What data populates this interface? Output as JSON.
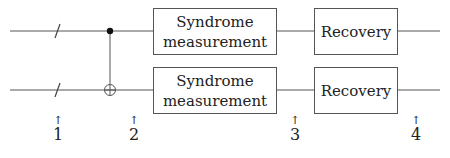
{
  "diagram": {
    "type": "quantum-circuit",
    "wires": [
      {
        "id": "top",
        "y": 31
      },
      {
        "id": "bottom",
        "y": 90
      }
    ],
    "gates": [
      {
        "type": "register-slash",
        "wire": "top"
      },
      {
        "type": "register-slash",
        "wire": "bottom"
      },
      {
        "type": "cnot",
        "control": "top",
        "target": "bottom"
      }
    ],
    "boxes": [
      {
        "id": "syndrome-top",
        "label_line1": "Syndrome",
        "label_line2": "measurement"
      },
      {
        "id": "syndrome-bottom",
        "label_line1": "Syndrome",
        "label_line2": "measurement"
      },
      {
        "id": "recovery-top",
        "label": "Recovery"
      },
      {
        "id": "recovery-bottom",
        "label": "Recovery"
      }
    ],
    "markers": [
      {
        "arrow": "↑",
        "label": "1"
      },
      {
        "arrow": "↑",
        "label": "2"
      },
      {
        "arrow": "↑",
        "label": "3"
      },
      {
        "arrow": "↑",
        "label": "4"
      }
    ],
    "colors": {
      "line": "#555555",
      "text": "#222222",
      "background": "#ffffff"
    }
  }
}
